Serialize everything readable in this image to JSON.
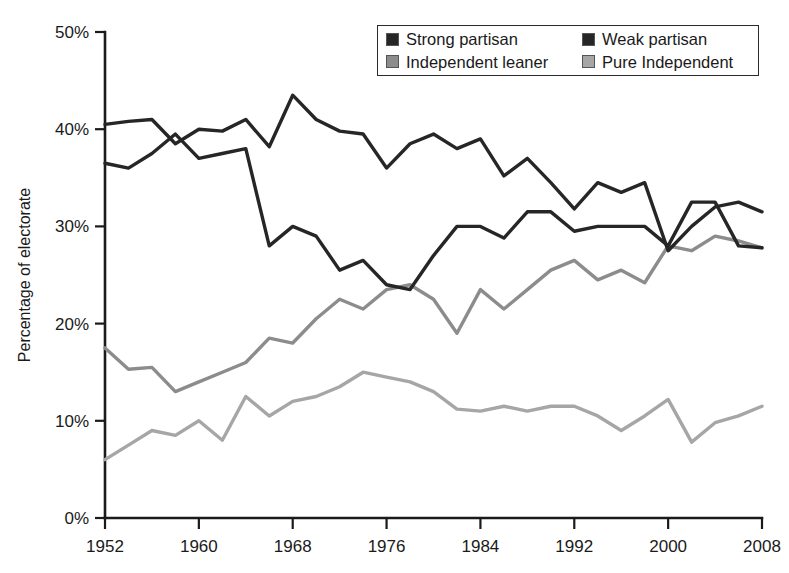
{
  "chart_data": {
    "type": "line",
    "title": "",
    "xlabel": "",
    "ylabel": "Percentage of electorate",
    "xlim": [
      1952,
      2008
    ],
    "ylim": [
      0,
      50
    ],
    "grid": false,
    "legend_position": "top-right",
    "x": [
      1952,
      1954,
      1956,
      1958,
      1960,
      1962,
      1964,
      1966,
      1968,
      1970,
      1972,
      1974,
      1976,
      1978,
      1980,
      1982,
      1984,
      1986,
      1988,
      1990,
      1992,
      1994,
      1996,
      1998,
      2000,
      2002,
      2004,
      2006,
      2008
    ],
    "xticks": [
      1952,
      1960,
      1968,
      1976,
      1984,
      1992,
      2000,
      2008
    ],
    "xtick_labels": [
      "1952",
      "1960",
      "1968",
      "1976",
      "1984",
      "1992",
      "2000",
      "2008"
    ],
    "yticks": [
      0,
      10,
      20,
      30,
      40,
      50
    ],
    "ytick_labels": [
      "0%",
      "10%",
      "20%",
      "30%",
      "40%",
      "50%"
    ],
    "series": [
      {
        "name": "Strong partisan",
        "color": "#262626",
        "values": [
          36.5,
          36.0,
          37.5,
          39.5,
          37.0,
          37.5,
          38.0,
          28.0,
          30.0,
          29.0,
          25.5,
          26.5,
          24.0,
          23.5,
          27.0,
          30.0,
          30.0,
          28.8,
          31.5,
          31.5,
          29.5,
          30.0,
          30.0,
          30.0,
          28.0,
          32.5,
          32.5,
          28.0,
          27.8
        ]
      },
      {
        "name": "Weak partisan",
        "color": "#262626",
        "values": [
          40.5,
          40.8,
          41.0,
          38.5,
          40.0,
          39.8,
          41.0,
          38.2,
          43.5,
          41.0,
          39.8,
          39.5,
          36.0,
          38.5,
          39.5,
          38.0,
          39.0,
          35.2,
          37.0,
          34.5,
          31.8,
          34.5,
          33.5,
          34.5,
          27.5,
          30.0,
          32.0,
          32.5,
          31.5
        ]
      },
      {
        "name": "Independent leaner",
        "color": "#8c8c8c",
        "values": [
          17.5,
          15.3,
          15.5,
          13.0,
          14.0,
          15.0,
          16.0,
          18.5,
          18.0,
          20.5,
          22.5,
          21.5,
          23.5,
          24.0,
          22.5,
          19.0,
          23.5,
          21.5,
          23.5,
          25.5,
          26.5,
          24.5,
          25.5,
          24.2,
          28.0,
          27.5,
          29.0,
          28.5,
          27.8
        ]
      },
      {
        "name": "Pure Independent",
        "color": "#a6a6a6",
        "values": [
          6.0,
          7.5,
          9.0,
          8.5,
          10.0,
          8.0,
          12.5,
          10.5,
          12.0,
          12.5,
          13.5,
          15.0,
          14.5,
          14.0,
          13.0,
          11.2,
          11.0,
          11.5,
          11.0,
          11.5,
          11.5,
          10.5,
          9.0,
          10.5,
          12.2,
          7.8,
          9.8,
          10.5,
          11.5
        ]
      }
    ]
  },
  "legend": {
    "items": [
      {
        "label": "Strong partisan",
        "color": "#262626"
      },
      {
        "label": "Weak partisan",
        "color": "#262626"
      },
      {
        "label": "Independent leaner",
        "color": "#8c8c8c"
      },
      {
        "label": "Pure Independent",
        "color": "#a6a6a6"
      }
    ]
  },
  "axes": {
    "y_title": "Percentage of electorate"
  }
}
